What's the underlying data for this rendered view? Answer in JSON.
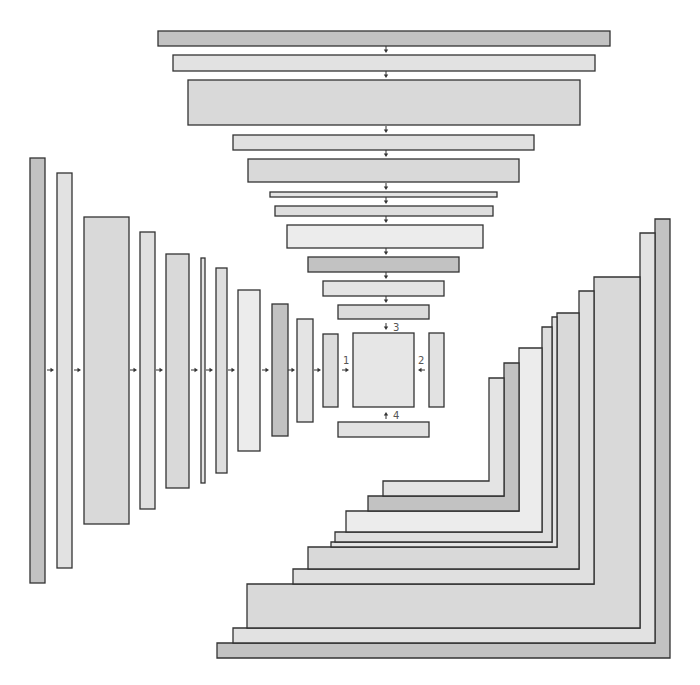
{
  "diagram": {
    "width": 700,
    "height": 685,
    "colors": {
      "dark": "#c2c2c2",
      "light_a": "#e2e2e2",
      "mid_a": "#d9d9d9",
      "light_b": "#e0e0e0",
      "light_c": "#e4e4e4",
      "mid_b": "#dedede",
      "lightest": "#ececec",
      "mid_c": "#dcdcdc",
      "outline": "#333333",
      "label": "#555555"
    },
    "top_bars": [
      {
        "x": 158,
        "y": 31,
        "w": 452,
        "h": 15,
        "fill": "#c2c2c2"
      },
      {
        "x": 173,
        "y": 55,
        "w": 422,
        "h": 16,
        "fill": "#e2e2e2"
      },
      {
        "x": 188,
        "y": 80,
        "w": 392,
        "h": 45,
        "fill": "#d9d9d9"
      },
      {
        "x": 233,
        "y": 135,
        "w": 301,
        "h": 15,
        "fill": "#e0e0e0"
      },
      {
        "x": 248,
        "y": 159,
        "w": 271,
        "h": 23,
        "fill": "#d9d9d9"
      },
      {
        "x": 270,
        "y": 192,
        "w": 227,
        "h": 5,
        "fill": "#e4e4e4"
      },
      {
        "x": 275,
        "y": 206,
        "w": 218,
        "h": 10,
        "fill": "#dedede"
      },
      {
        "x": 287,
        "y": 225,
        "w": 196,
        "h": 23,
        "fill": "#ececec"
      },
      {
        "x": 308,
        "y": 257,
        "w": 151,
        "h": 15,
        "fill": "#c2c2c2"
      },
      {
        "x": 323,
        "y": 281,
        "w": 121,
        "h": 15,
        "fill": "#e4e4e4"
      },
      {
        "x": 338,
        "y": 305,
        "w": 91,
        "h": 14,
        "fill": "#dcdcdc"
      }
    ],
    "left_bars": [
      {
        "x": 30,
        "y": 158,
        "w": 15,
        "h": 425,
        "fill": "#c2c2c2"
      },
      {
        "x": 57,
        "y": 173,
        "w": 15,
        "h": 395,
        "fill": "#e2e2e2"
      },
      {
        "x": 84,
        "y": 217,
        "w": 45,
        "h": 307,
        "fill": "#d9d9d9"
      },
      {
        "x": 140,
        "y": 232,
        "w": 15,
        "h": 277,
        "fill": "#e0e0e0"
      },
      {
        "x": 166,
        "y": 254,
        "w": 23,
        "h": 234,
        "fill": "#d9d9d9"
      },
      {
        "x": 201,
        "y": 258,
        "w": 4,
        "h": 225,
        "fill": "#e4e4e4"
      },
      {
        "x": 216,
        "y": 268,
        "w": 11,
        "h": 205,
        "fill": "#dedede"
      },
      {
        "x": 238,
        "y": 290,
        "w": 22,
        "h": 161,
        "fill": "#ececec"
      },
      {
        "x": 272,
        "y": 304,
        "w": 16,
        "h": 132,
        "fill": "#c2c2c2"
      },
      {
        "x": 297,
        "y": 319,
        "w": 16,
        "h": 103,
        "fill": "#e4e4e4"
      },
      {
        "x": 323,
        "y": 334,
        "w": 15,
        "h": 73,
        "fill": "#dcdcdc"
      }
    ],
    "center_square": {
      "x": 353,
      "y": 333,
      "w": 61,
      "h": 74,
      "fill": "#e6e6e6"
    },
    "right_small_bar": {
      "x": 429,
      "y": 333,
      "w": 15,
      "h": 74,
      "fill": "#e2e2e2"
    },
    "bottom_small_bar": {
      "x": 338,
      "y": 422,
      "w": 91,
      "h": 15,
      "fill": "#e2e2e2"
    },
    "right_l_shapes": [
      {
        "vx1": 655,
        "vx2": 670,
        "vtop": 219,
        "hx1": 217,
        "htop": 643,
        "hbot": 658,
        "fill": "#c2c2c2"
      },
      {
        "vx1": 640,
        "vx2": 655,
        "vtop": 233,
        "hx1": 233,
        "htop": 628,
        "hbot": 643,
        "fill": "#e2e2e2"
      },
      {
        "vx1": 594,
        "vx2": 640,
        "vtop": 277,
        "hx1": 247,
        "htop": 584,
        "hbot": 628,
        "fill": "#d9d9d9"
      },
      {
        "vx1": 579,
        "vx2": 594,
        "vtop": 291,
        "hx1": 293,
        "htop": 569,
        "hbot": 584,
        "fill": "#e0e0e0"
      },
      {
        "vx1": 557,
        "vx2": 579,
        "vtop": 313,
        "hx1": 308,
        "htop": 547,
        "hbot": 569,
        "fill": "#d9d9d9"
      },
      {
        "vx1": 552,
        "vx2": 557,
        "vtop": 317,
        "hx1": 331,
        "htop": 542,
        "hbot": 547,
        "fill": "#e4e4e4"
      },
      {
        "vx1": 542,
        "vx2": 552,
        "vtop": 327,
        "hx1": 335,
        "htop": 532,
        "hbot": 542,
        "fill": "#dedede"
      },
      {
        "vx1": 519,
        "vx2": 542,
        "vtop": 348,
        "hx1": 346,
        "htop": 511,
        "hbot": 532,
        "fill": "#ececec"
      },
      {
        "vx1": 504,
        "vx2": 519,
        "vtop": 363,
        "hx1": 368,
        "htop": 496,
        "hbot": 511,
        "fill": "#c2c2c2"
      },
      {
        "vx1": 489,
        "vx2": 504,
        "vtop": 378,
        "hx1": 383,
        "htop": 481,
        "hbot": 496,
        "fill": "#e4e4e4"
      }
    ],
    "arrows": [
      {
        "x": 386,
        "y": 50,
        "dir": "down"
      },
      {
        "x": 386,
        "y": 75,
        "dir": "down"
      },
      {
        "x": 386,
        "y": 130,
        "dir": "down"
      },
      {
        "x": 386,
        "y": 154,
        "dir": "down"
      },
      {
        "x": 386,
        "y": 187,
        "dir": "down"
      },
      {
        "x": 386,
        "y": 201,
        "dir": "down"
      },
      {
        "x": 386,
        "y": 220,
        "dir": "down"
      },
      {
        "x": 386,
        "y": 252,
        "dir": "down"
      },
      {
        "x": 386,
        "y": 276,
        "dir": "down"
      },
      {
        "x": 386,
        "y": 300,
        "dir": "down"
      },
      {
        "x": 386,
        "y": 327,
        "dir": "down"
      },
      {
        "x": 51,
        "y": 370,
        "dir": "right"
      },
      {
        "x": 78,
        "y": 370,
        "dir": "right"
      },
      {
        "x": 134,
        "y": 370,
        "dir": "right"
      },
      {
        "x": 160,
        "y": 370,
        "dir": "right"
      },
      {
        "x": 195,
        "y": 370,
        "dir": "right"
      },
      {
        "x": 210,
        "y": 370,
        "dir": "right"
      },
      {
        "x": 232,
        "y": 370,
        "dir": "right"
      },
      {
        "x": 266,
        "y": 370,
        "dir": "right"
      },
      {
        "x": 292,
        "y": 370,
        "dir": "right"
      },
      {
        "x": 318,
        "y": 370,
        "dir": "right"
      },
      {
        "x": 346,
        "y": 370,
        "dir": "right"
      },
      {
        "x": 421,
        "y": 370,
        "dir": "left"
      },
      {
        "x": 386,
        "y": 415,
        "dir": "up"
      }
    ],
    "labels": [
      {
        "text": "1"
      },
      {
        "text": "2"
      },
      {
        "text": "3"
      },
      {
        "text": "4"
      }
    ]
  }
}
